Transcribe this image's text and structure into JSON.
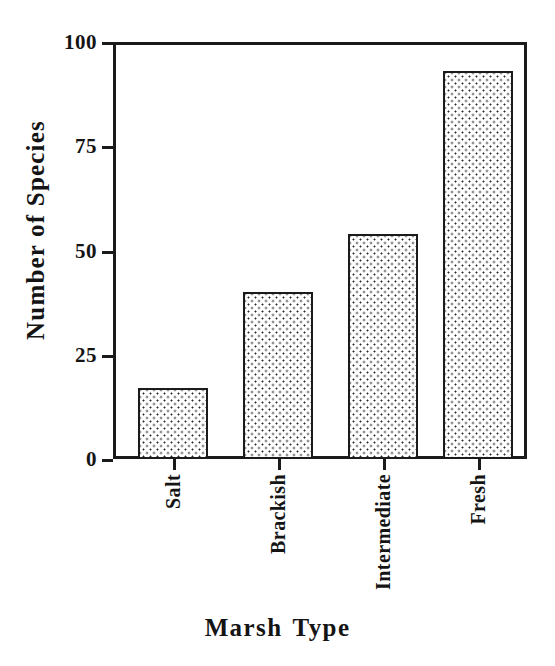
{
  "chart_data": {
    "type": "bar",
    "title": "",
    "xlabel": "Marsh Type",
    "ylabel": "Number of Species",
    "categories": [
      "Salt",
      "Brackish",
      "Intermediate",
      "Fresh"
    ],
    "values": [
      17,
      40,
      54,
      93
    ],
    "ylim": [
      0,
      100
    ],
    "yticks": [
      0,
      25,
      50,
      75,
      100
    ],
    "ytick_labels": [
      "0",
      "25",
      "50",
      "75",
      "100"
    ],
    "grid": false,
    "legend": false,
    "bar_fill": "dotted-pattern",
    "bar_edge_color": "#1b1b1b",
    "axis_color": "#1b1b1b",
    "background_color": "#ffffff",
    "xtick_label_rotation": 90,
    "series": [
      {
        "name": "Number of Species",
        "values": [
          17,
          40,
          54,
          93
        ]
      }
    ],
    "points": [
      {
        "category": "Salt",
        "value": 17
      },
      {
        "category": "Brackish",
        "value": 40
      },
      {
        "category": "Intermediate",
        "value": 54
      },
      {
        "category": "Fresh",
        "value": 93
      }
    ]
  },
  "axes": {
    "y": {
      "title": "Number of Species",
      "ticks": [
        {
          "label": "100",
          "value": 100
        },
        {
          "label": "75",
          "value": 75
        },
        {
          "label": "50",
          "value": 50
        },
        {
          "label": "25",
          "value": 25
        },
        {
          "label": "0",
          "value": 0
        }
      ]
    },
    "x": {
      "title_part1": "Marsh",
      "title_part2": "Type",
      "title": "Marsh Type",
      "categories": [
        "Salt",
        "Brackish",
        "Intermediate",
        "Fresh"
      ]
    }
  }
}
